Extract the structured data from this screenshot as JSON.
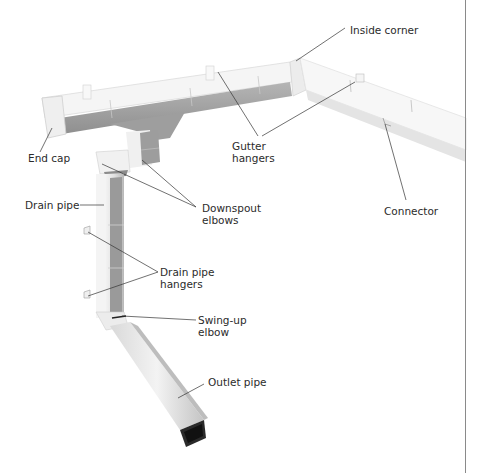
{
  "figure": {
    "labels": {
      "inside_corner": "Inside corner",
      "end_cap": "End cap",
      "gutter_hangers_1": "Gutter",
      "gutter_hangers_2": "hangers",
      "drain_pipe": "Drain pipe",
      "downspout_elbows_1": "Downspout",
      "downspout_elbows_2": "elbows",
      "connector": "Connector",
      "drain_pipe_hangers_1": "Drain pipe",
      "drain_pipe_hangers_2": "hangers",
      "swing_up_elbow_1": "Swing-up",
      "swing_up_elbow_2": "elbow",
      "outlet_pipe": "Outlet pipe"
    },
    "colors": {
      "gutter_face": "#f4f4f4",
      "gutter_shadow": "#a9a9a9",
      "pipe_dark": "#9c9c9c",
      "leader_line": "#333333",
      "text": "#2b2b2b",
      "page_rule": "#8a8a8a"
    }
  }
}
